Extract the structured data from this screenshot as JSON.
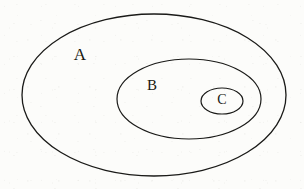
{
  "diagram": {
    "background_color": "#fcfcfa",
    "stroke_color": "#1a1a18",
    "label_color": "#17170f",
    "sets": [
      {
        "id": "A",
        "label": "A",
        "shape": "ellipse",
        "cx": 154,
        "cy": 95,
        "rx": 132,
        "ry": 81,
        "stroke_width": 1.3,
        "label_x": 80,
        "label_y": 56,
        "label_font_size": 17
      },
      {
        "id": "B",
        "label": "B",
        "shape": "ellipse",
        "cx": 189,
        "cy": 99,
        "rx": 72,
        "ry": 40,
        "stroke_width": 1.2,
        "label_x": 152,
        "label_y": 87,
        "label_font_size": 15
      },
      {
        "id": "C",
        "label": "C",
        "shape": "ellipse",
        "cx": 222,
        "cy": 101,
        "rx": 21,
        "ry": 13,
        "stroke_width": 1.2,
        "label_x": 222,
        "label_y": 101,
        "label_font_size": 14
      }
    ],
    "relations": "C is a subset of B, and B is a subset of A"
  }
}
